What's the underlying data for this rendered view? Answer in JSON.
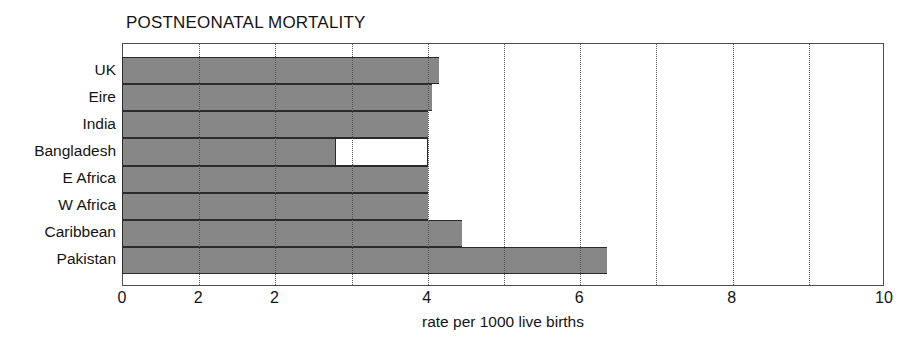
{
  "chart_data": {
    "type": "bar",
    "orientation": "horizontal",
    "title": "POSTNEONATAL MORTALITY",
    "xlabel": "rate per 1000 live births",
    "ylabel": "",
    "xlim": [
      0,
      10
    ],
    "grid": true,
    "gridlines": [
      1,
      2,
      3,
      4,
      5,
      6,
      7,
      8,
      9
    ],
    "legend": null,
    "categories": [
      "UK",
      "Eire",
      "India",
      "Bangladesh",
      "E Africa",
      "W Africa",
      "Caribbean",
      "Pakistan"
    ],
    "values": [
      4.15,
      4.05,
      4.0,
      4.0,
      4.0,
      4.0,
      4.45,
      6.35
    ],
    "filled_values": [
      4.15,
      4.05,
      4.0,
      2.8,
      4.0,
      4.0,
      4.45,
      6.35
    ],
    "x_tick_positions": [
      0,
      1,
      2,
      4,
      6,
      8,
      10
    ],
    "x_tick_labels": [
      "0",
      "2",
      "2",
      "4",
      "6",
      "8",
      "10"
    ],
    "colors": {
      "bar_fill": "#878787",
      "bar_outline": "#2b2b2b",
      "bar_unfilled": "#ffffff",
      "frame": "#4d4d4d",
      "gridline": "#555555",
      "text": "#141414",
      "background": "#ffffff"
    }
  }
}
